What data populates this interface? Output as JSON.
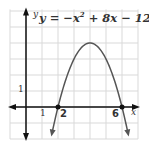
{
  "chart_data": {
    "type": "line",
    "equation": {
      "lhs": "y",
      "eq": " = −x",
      "exp": "2",
      "rest": " + 8x − 12"
    },
    "xlabel": "x",
    "ylabel": "y",
    "xlim": [
      -1,
      7
    ],
    "ylim": [
      -2,
      6
    ],
    "grid": true,
    "tick_labels": {
      "x_unit": "1",
      "y_unit": "1",
      "root1": "2",
      "root2": "6"
    },
    "series": [
      {
        "name": "y = -x^2 + 8x - 12",
        "x": [
          1.5,
          2,
          3,
          4,
          5,
          6,
          6.5
        ],
        "y": [
          -2.25,
          0,
          3,
          4,
          3,
          0,
          -2.25
        ]
      }
    ],
    "points": [
      {
        "x": 2,
        "y": 0
      },
      {
        "x": 6,
        "y": 0
      }
    ],
    "vertex": {
      "x": 4,
      "y": 4
    },
    "colors": {
      "grid": "#d9d9d9",
      "axis": "#111111",
      "curve": "#555555"
    }
  }
}
